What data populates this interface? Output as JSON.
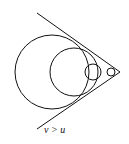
{
  "figure": {
    "label": "v > u",
    "stroke_color": "#111111",
    "background": "#ffffff"
  },
  "geometry": {
    "apex": [
      120,
      72
    ],
    "upper_line_start": [
      37,
      13
    ],
    "lower_line_start": [
      37,
      129
    ],
    "circles": [
      {
        "cx": 52,
        "cy": 72,
        "r": 37
      },
      {
        "cx": 74,
        "cy": 72,
        "r": 24
      },
      {
        "cx": 93,
        "cy": 72,
        "r": 8
      },
      {
        "cx": 111,
        "cy": 72,
        "r": 4
      }
    ]
  }
}
